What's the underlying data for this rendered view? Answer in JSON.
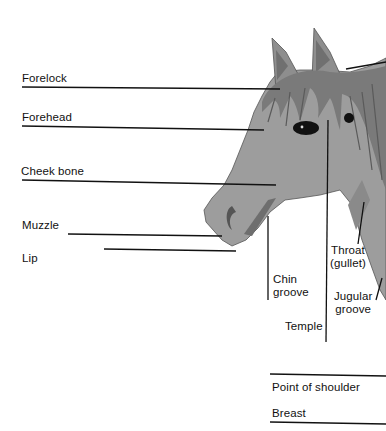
{
  "diagram": {
    "colors": {
      "coat": "#9d9d9d",
      "coat_dark": "#6e6e6e",
      "mane": "#7a7a7a",
      "eye": "#111111",
      "line": "#111111",
      "background": "#ffffff"
    },
    "labels": [
      {
        "id": "forelock",
        "text": "Forelock"
      },
      {
        "id": "forehead",
        "text": "Forehead"
      },
      {
        "id": "cheek-bone",
        "text": "Cheek bone"
      },
      {
        "id": "muzzle",
        "text": "Muzzle"
      },
      {
        "id": "lip",
        "text": "Lip"
      },
      {
        "id": "chin-groove",
        "line1": "Chin",
        "line2": "groove"
      },
      {
        "id": "temple",
        "text": "Temple"
      },
      {
        "id": "throat",
        "line1": "Throat",
        "line2": "(gullet)"
      },
      {
        "id": "jugular-groove",
        "line1": "Jugular",
        "line2": "groove"
      },
      {
        "id": "point-of-shoulder",
        "text": "Point of shoulder"
      },
      {
        "id": "breast",
        "text": "Breast"
      }
    ]
  }
}
